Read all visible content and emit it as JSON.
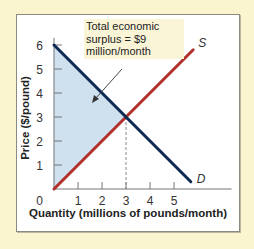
{
  "chart_data": {
    "type": "line",
    "title": "",
    "xlabel": "Quantity (millions of pounds/month)",
    "ylabel": "Price ($/pound)",
    "x_ticks": [
      "0",
      "1",
      "2",
      "3",
      "4",
      "5"
    ],
    "y_ticks": [
      "1",
      "2",
      "3",
      "4",
      "5",
      "6"
    ],
    "xlim": [
      0,
      6.2
    ],
    "ylim": [
      0,
      6.3
    ],
    "grid": false,
    "series": [
      {
        "name": "S",
        "label": "S",
        "color": "#b0302c",
        "points": [
          [
            0,
            0
          ],
          [
            5.8,
            5.8
          ]
        ]
      },
      {
        "name": "D",
        "label": "D",
        "color": "#0d2a55",
        "points": [
          [
            0,
            6
          ],
          [
            5.7,
            0.3
          ]
        ]
      }
    ],
    "equilibrium": {
      "quantity": 3,
      "price": 3
    },
    "shaded_region": {
      "name": "total economic surplus",
      "vertices": [
        [
          0,
          0
        ],
        [
          0,
          6
        ],
        [
          3,
          3
        ]
      ],
      "color": "#cfe1ef"
    },
    "annotation": {
      "text_lines": [
        "Total economic",
        "surplus = $9",
        "million/month"
      ],
      "value": 9
    }
  },
  "colors": {
    "background": "#fbf5cf",
    "frame": "#ffffff",
    "supply": "#b0302c",
    "demand": "#0d2a55",
    "shade": "#cfe1ef"
  }
}
